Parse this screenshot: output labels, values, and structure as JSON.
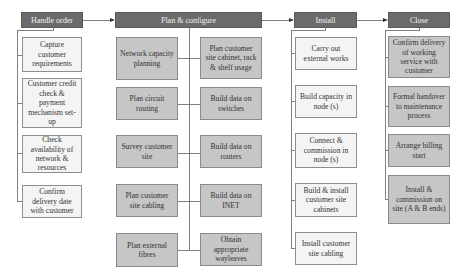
{
  "phases": [
    {
      "title": "Handle order",
      "style": "light",
      "tasks": [
        "Capture customer requirements",
        "Customer credit check & payment mechanism set-up",
        "Check availability of network & resources",
        "Confirm delivery date with customer"
      ]
    },
    {
      "title": "Plan & configure",
      "style": "dark",
      "left_tasks": [
        "Network capacity planning",
        "Plan circuit routing",
        "Survey customer site",
        "Plan customer site cabling",
        "Plan external fibres"
      ],
      "right_tasks": [
        "Plan customer site cabinet, rack & shelf usage",
        "Build data on switches",
        "Build data on routers",
        "Build data on INET",
        "Obtain appropriate wayleaves"
      ]
    },
    {
      "title": "Install",
      "style": "light",
      "tasks": [
        "Carry out external works",
        "Build capacity in node (s)",
        "Connect & commission in node (s)",
        "Build & install customer site cabinets",
        "Install customer site cabling"
      ]
    },
    {
      "title": "Close",
      "style": "dark",
      "tasks": [
        "Confirm delivery of working service with customer",
        "Formal handover to maintenance process",
        "Arrange billing start",
        "Install & commission on site (A & B ends)"
      ]
    }
  ],
  "colors": {
    "header_bg": "#6b6b6b",
    "light_box": "#f4f4f4",
    "dark_box": "#c6c6c6",
    "connector": "#808080"
  }
}
